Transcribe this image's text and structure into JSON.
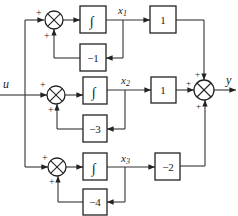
{
  "diagram": {
    "type": "block-diagram",
    "input_label": "u",
    "output_label": "y",
    "integrator_symbol": "∫",
    "rows": [
      {
        "state_label": "x",
        "state_subscript": "1",
        "feedback_gain": "−1",
        "output_gain": "1",
        "sum_signs": [
          "+",
          "+"
        ]
      },
      {
        "state_label": "x",
        "state_subscript": "2",
        "feedback_gain": "−3",
        "output_gain": "1",
        "sum_signs": [
          "+",
          "+"
        ]
      },
      {
        "state_label": "x",
        "state_subscript": "3",
        "feedback_gain": "−4",
        "output_gain": "−2",
        "sum_signs": [
          "+",
          "+"
        ]
      }
    ],
    "output_sum_signs": [
      "+",
      "+",
      "+"
    ]
  }
}
